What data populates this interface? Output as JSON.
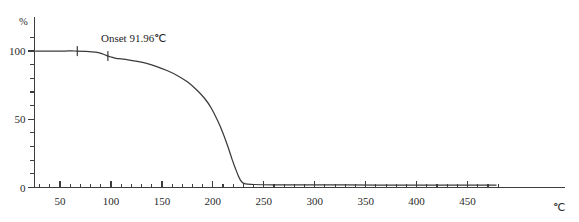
{
  "chart_data": {
    "type": "line",
    "title": "",
    "xlabel": "℃",
    "ylabel": "%",
    "xlim": [
      25,
      480
    ],
    "ylim": [
      0,
      110
    ],
    "x_ticks": [
      50,
      100,
      150,
      200,
      250,
      300,
      350,
      400,
      450
    ],
    "x_tick_labels": [
      "50",
      "100",
      "150",
      "200",
      "250",
      "300",
      "350",
      "400",
      "450"
    ],
    "x_minor_step": 10,
    "y_ticks": [
      0,
      50,
      100
    ],
    "y_tick_labels": [
      "0",
      "50",
      "100"
    ],
    "y_minor_step": 10,
    "grid": false,
    "legend": null,
    "line_color": "#3a3a3a",
    "axis_color": "#3d3d3d",
    "series": [
      {
        "name": "TG",
        "x": [
          26,
          35,
          45,
          55,
          65,
          75,
          85,
          92,
          96,
          100,
          105,
          110,
          118,
          126,
          135,
          145,
          155,
          165,
          175,
          185,
          192,
          198,
          205,
          210,
          215,
          219,
          222,
          225,
          228,
          232,
          240,
          260,
          290,
          330,
          380,
          430,
          478
        ],
        "y": [
          100,
          100,
          100,
          100,
          100,
          99.8,
          99.2,
          97.8,
          96.6,
          95.6,
          94.6,
          94.2,
          93.4,
          92.4,
          90.9,
          88.6,
          85.7,
          82.1,
          77.4,
          70.9,
          65.2,
          58.8,
          48.5,
          39.8,
          29.5,
          20.4,
          14.3,
          8.6,
          4.4,
          2.6,
          2.2,
          2.0,
          1.9,
          1.9,
          1.8,
          1.8,
          1.8
        ]
      }
    ],
    "annotations": [
      {
        "name": "onset",
        "label": "Onset",
        "value": "91.96℃",
        "text": "Onset    91.96℃",
        "x_value": 91.96,
        "marker_x_values": [
          67,
          97
        ]
      }
    ]
  },
  "axis": {
    "y_unit": "%",
    "x_unit": "℃"
  },
  "annotation_text": {
    "onset_label": "Onset",
    "onset_value": "91.96℃"
  }
}
